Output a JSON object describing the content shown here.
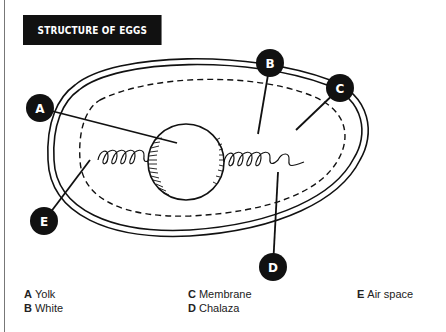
{
  "title": "STRUCTURE OF EGGS",
  "callouts": [
    {
      "letter": "A",
      "x": 40,
      "y": 108
    },
    {
      "letter": "B",
      "x": 270,
      "y": 63
    },
    {
      "letter": "C",
      "x": 340,
      "y": 88
    },
    {
      "letter": "E",
      "x": 44,
      "y": 221
    },
    {
      "letter": "D",
      "x": 273,
      "y": 267
    }
  ],
  "legend": [
    {
      "letter": "A",
      "label": "Yolk"
    },
    {
      "letter": "B",
      "label": "White"
    },
    {
      "letter": "C",
      "label": "Membrane"
    },
    {
      "letter": "D",
      "label": "Chalaza"
    },
    {
      "letter": "E",
      "label": "Air space"
    }
  ],
  "colors": {
    "ink": "#111111",
    "background": "#ffffff",
    "rule": "#777777"
  }
}
